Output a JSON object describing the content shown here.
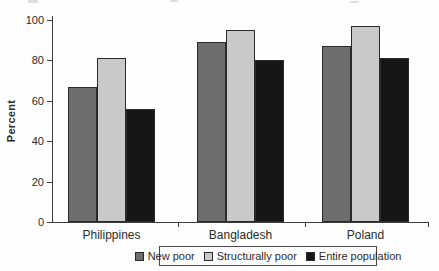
{
  "chart_data": {
    "type": "bar",
    "title": "",
    "xlabel": "",
    "ylabel": "Percent",
    "categories": [
      "Philippines",
      "Bangladesh",
      "Poland"
    ],
    "series": [
      {
        "name": "New poor",
        "color": "#6e6e6e",
        "values": [
          67,
          89,
          87
        ]
      },
      {
        "name": "Structurally poor",
        "color": "#c9c9c9",
        "values": [
          81,
          95,
          97
        ]
      },
      {
        "name": "Entire population",
        "color": "#161616",
        "values": [
          56,
          80,
          81
        ]
      }
    ],
    "ylim": [
      0,
      100
    ],
    "yticks": [
      0,
      20,
      40,
      60,
      80,
      100
    ],
    "grid": false,
    "legend_position": "bottom"
  }
}
